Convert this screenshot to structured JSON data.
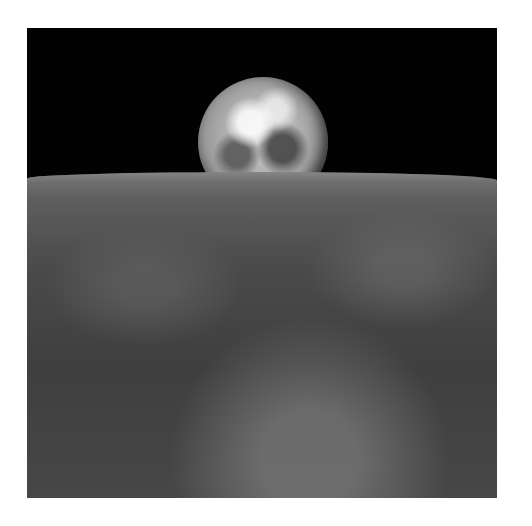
{
  "image": {
    "subject": "Earth rising above the lunar horizon",
    "palette": {
      "background": "#ffffff",
      "space": "#020202",
      "lunar_surface": "#4a4a4a",
      "earth_highlight": "#d8d8d8"
    }
  }
}
